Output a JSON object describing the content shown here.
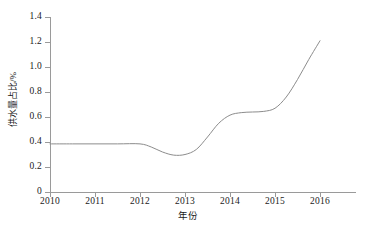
{
  "chart_data": {
    "type": "line",
    "title": "",
    "subtitle": "",
    "xlabel": "年份",
    "ylabel": "供水量占比/%",
    "xlim": [
      2009.8,
      2016.8
    ],
    "ylim": [
      0,
      1.4
    ],
    "grid": false,
    "legend": null,
    "legend_position": "none",
    "x_ticks": [
      "2010",
      "2011",
      "2012",
      "2013",
      "2014",
      "2015",
      "2016"
    ],
    "x_tick_values": [
      2010,
      2011,
      2012,
      2013,
      2014,
      2015,
      2016
    ],
    "y_ticks": [
      "0",
      "0.2",
      "0.4",
      "0.6",
      "0.8",
      "1.0",
      "1.2",
      "1.4"
    ],
    "y_tick_values": [
      0,
      0.2,
      0.4,
      0.6,
      0.8,
      1.0,
      1.2,
      1.4
    ],
    "line_color": "#8c8c8c",
    "line_width": 1,
    "series": [
      {
        "name": "供水量占比",
        "x": [
          2010,
          2010.5,
          2011,
          2011.5,
          2012,
          2012.25,
          2012.5,
          2012.75,
          2013,
          2013.25,
          2013.5,
          2013.75,
          2014,
          2014.25,
          2014.5,
          2014.75,
          2015,
          2015.25,
          2015.5,
          2015.75,
          2016
        ],
        "values": [
          0.385,
          0.385,
          0.385,
          0.385,
          0.385,
          0.36,
          0.32,
          0.295,
          0.3,
          0.34,
          0.44,
          0.55,
          0.615,
          0.635,
          0.64,
          0.645,
          0.67,
          0.76,
          0.9,
          1.06,
          1.21
        ]
      }
    ],
    "annotations": []
  },
  "axis_geometry": {
    "plot_left_px": 50,
    "plot_right_px": 356,
    "plot_top_px": 17,
    "plot_bottom_px": 192,
    "x_tick_spacing_px": 45,
    "y_tick_spacing_px": 25
  }
}
